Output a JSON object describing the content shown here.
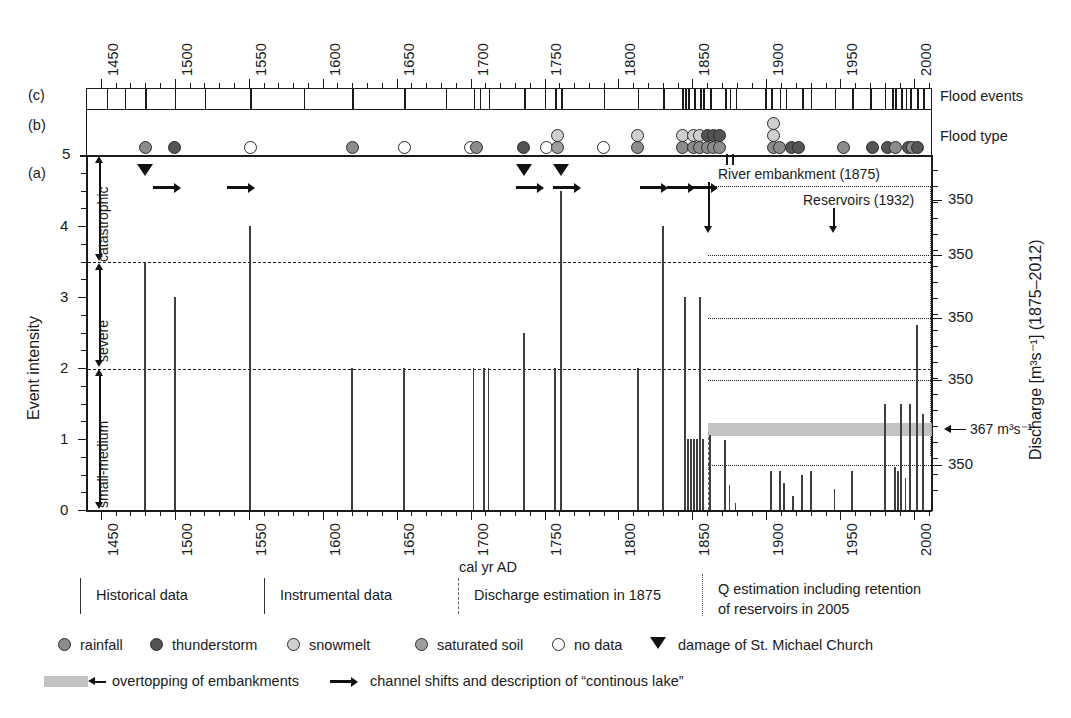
{
  "figure": {
    "panels": [
      {
        "tag": "(c)",
        "right_label": "Flood events"
      },
      {
        "tag": "(b)",
        "right_label": "Flood type"
      },
      {
        "tag": "(a)",
        "right_label": ""
      }
    ],
    "axis_x_label": "cal yr AD",
    "axis_y_left_label": "Event intensity",
    "axis_y_right_label": "Discharge [m³s⁻¹] (1875–2012)",
    "intensity_classes": [
      "catastrophic",
      "severe",
      "small-medium"
    ],
    "annotations": [
      {
        "text": "River embankment (1875)",
        "year": 1875
      },
      {
        "text": "Reservoirs (1932)",
        "year": 1932
      },
      {
        "text": "367 m³s⁻¹",
        "year": null
      }
    ],
    "data_period_bands": [
      {
        "label": "Historical data"
      },
      {
        "label": "Instrumental data"
      },
      {
        "label": "Discharge estimation in 1875"
      },
      {
        "label": "Q estimation including retention of reservoirs in 2005"
      }
    ],
    "legend_markers": [
      {
        "name": "rainfall",
        "color": "#8c8c8c"
      },
      {
        "name": "thunderstorm",
        "color": "#545454"
      },
      {
        "name": "snowmelt",
        "color": "#cfcfcf"
      },
      {
        "name": "saturated soil",
        "color": "#9e9e9e"
      },
      {
        "name": "no data",
        "color": "#ffffff"
      }
    ],
    "legend_symbols": [
      {
        "name": "damage of St. Michael Church",
        "glyph": "triangle-down"
      },
      {
        "name": "overtopping of embankments",
        "glyph": "gray-band"
      },
      {
        "name": "channel shifts and description of “continous lake”",
        "glyph": "arrow-right"
      }
    ]
  },
  "chart_data": {
    "type": "bar",
    "title": "",
    "xlabel": "cal yr AD",
    "ylabel": "Event intensity",
    "y2label": "Discharge [m³s⁻¹] (1875–2012)",
    "xlim": [
      1440,
      2012
    ],
    "ylim": [
      0,
      5
    ],
    "xticks": [
      1450,
      1500,
      1550,
      1600,
      1650,
      1700,
      1750,
      1800,
      1850,
      1900,
      1950,
      2000
    ],
    "xtick_labels": [
      "1450",
      "1500",
      "1550",
      "1600",
      "1650",
      "1700",
      "1750",
      "1800",
      "1850",
      "1900",
      "1950",
      "2000"
    ],
    "yticks": [
      0,
      1,
      2,
      3,
      4,
      5
    ],
    "ytick_labels": [
      "0",
      "1",
      "2",
      "3",
      "4",
      "5"
    ],
    "y2ticks_labels": [
      "350",
      "350",
      "350",
      "350",
      "367 m³s⁻¹",
      "350"
    ],
    "grid": "dashed-horizontal-at-2-and-3.5",
    "legend_position": "below-axes",
    "class_boundaries": {
      "small-medium": [
        0,
        2
      ],
      "severe": [
        2,
        3.5
      ],
      "catastrophic": [
        3.5,
        5
      ]
    },
    "series": [
      {
        "name": "Event intensity (a)",
        "points": [
          {
            "year": 1480,
            "value": 3.5
          },
          {
            "year": 1500,
            "value": 3.0
          },
          {
            "year": 1551,
            "value": 4.0
          },
          {
            "year": 1620,
            "value": 2.0
          },
          {
            "year": 1655,
            "value": 2.0
          },
          {
            "year": 1702,
            "value": 2.0
          },
          {
            "year": 1709,
            "value": 2.0
          },
          {
            "year": 1712,
            "value": 2.0
          },
          {
            "year": 1736,
            "value": 2.5
          },
          {
            "year": 1757,
            "value": 2.0
          },
          {
            "year": 1761,
            "value": 4.5
          },
          {
            "year": 1813,
            "value": 2.0
          },
          {
            "year": 1830,
            "value": 4.0
          },
          {
            "year": 1845,
            "value": 3.0
          },
          {
            "year": 1847,
            "value": 1.0
          },
          {
            "year": 1849,
            "value": 1.0
          },
          {
            "year": 1851,
            "value": 1.0
          },
          {
            "year": 1853,
            "value": 1.0
          },
          {
            "year": 1855,
            "value": 3.0
          },
          {
            "year": 1857,
            "value": 1.0
          },
          {
            "year": 1862,
            "value": 1.05
          },
          {
            "year": 1872,
            "value": 0.98
          },
          {
            "year": 1875,
            "value": 0.35
          },
          {
            "year": 1879,
            "value": 0.1
          },
          {
            "year": 1903,
            "value": 0.55
          },
          {
            "year": 1909,
            "value": 0.55
          },
          {
            "year": 1912,
            "value": 0.38
          },
          {
            "year": 1918,
            "value": 0.2
          },
          {
            "year": 1924,
            "value": 0.5
          },
          {
            "year": 1930,
            "value": 0.55
          },
          {
            "year": 1946,
            "value": 0.3
          },
          {
            "year": 1958,
            "value": 0.55
          },
          {
            "year": 1980,
            "value": 1.5
          },
          {
            "year": 1987,
            "value": 0.6
          },
          {
            "year": 1989,
            "value": 0.55
          },
          {
            "year": 1991,
            "value": 1.5
          },
          {
            "year": 1994,
            "value": 0.45
          },
          {
            "year": 1997,
            "value": 1.5
          },
          {
            "year": 2002,
            "value": 2.6
          },
          {
            "year": 2006,
            "value": 1.35
          }
        ]
      }
    ],
    "flood_events_ticks": [
      1454,
      1466,
      1480,
      1500,
      1520,
      1551,
      1587,
      1620,
      1655,
      1683,
      1702,
      1706,
      1712,
      1736,
      1750,
      1757,
      1761,
      1790,
      1813,
      1830,
      1843,
      1845,
      1847,
      1851,
      1855,
      1857,
      1862,
      1872,
      1875,
      1879,
      1899,
      1903,
      1909,
      1913,
      1924,
      1930,
      1946,
      1958,
      1970,
      1980,
      1985,
      1987,
      1991,
      1994,
      1997,
      2002,
      2006
    ],
    "flood_type_points": [
      {
        "year": 1480,
        "type": "rainfall",
        "row": 0
      },
      {
        "year": 1500,
        "type": "thunderstorm",
        "row": 0
      },
      {
        "year": 1551,
        "type": "no data",
        "row": 0
      },
      {
        "year": 1620,
        "type": "rainfall",
        "row": 0
      },
      {
        "year": 1655,
        "type": "no data",
        "row": 0
      },
      {
        "year": 1700,
        "type": "no data",
        "row": 0
      },
      {
        "year": 1704,
        "type": "rainfall",
        "row": 0
      },
      {
        "year": 1736,
        "type": "thunderstorm",
        "row": 0
      },
      {
        "year": 1751,
        "type": "no data",
        "row": 0
      },
      {
        "year": 1759,
        "type": "snowmelt",
        "row": 1
      },
      {
        "year": 1759,
        "type": "saturated soil",
        "row": 0
      },
      {
        "year": 1790,
        "type": "no data",
        "row": 0
      },
      {
        "year": 1813,
        "type": "snowmelt",
        "row": 1
      },
      {
        "year": 1813,
        "type": "rainfall",
        "row": 0
      },
      {
        "year": 1843,
        "type": "snowmelt",
        "row": 1
      },
      {
        "year": 1843,
        "type": "rainfall",
        "row": 0
      },
      {
        "year": 1851,
        "type": "snowmelt",
        "row": 1
      },
      {
        "year": 1851,
        "type": "rainfall",
        "row": 0
      },
      {
        "year": 1855,
        "type": "snowmelt",
        "row": 1
      },
      {
        "year": 1855,
        "type": "rainfall",
        "row": 0
      },
      {
        "year": 1860,
        "type": "thunderstorm",
        "row": 1
      },
      {
        "year": 1860,
        "type": "rainfall",
        "row": 0
      },
      {
        "year": 1864,
        "type": "thunderstorm",
        "row": 1
      },
      {
        "year": 1864,
        "type": "rainfall",
        "row": 0
      },
      {
        "year": 1868,
        "type": "thunderstorm",
        "row": 1
      },
      {
        "year": 1868,
        "type": "rainfall",
        "row": 0
      },
      {
        "year": 1905,
        "type": "snowmelt",
        "row": 2
      },
      {
        "year": 1905,
        "type": "snowmelt",
        "row": 1
      },
      {
        "year": 1905,
        "type": "rainfall",
        "row": 0
      },
      {
        "year": 1909,
        "type": "rainfall",
        "row": 0
      },
      {
        "year": 1917,
        "type": "thunderstorm",
        "row": 0
      },
      {
        "year": 1922,
        "type": "thunderstorm",
        "row": 0
      },
      {
        "year": 1952,
        "type": "rainfall",
        "row": 0
      },
      {
        "year": 1972,
        "type": "thunderstorm",
        "row": 0
      },
      {
        "year": 1982,
        "type": "thunderstorm",
        "row": 0
      },
      {
        "year": 1987,
        "type": "rainfall",
        "row": 0
      },
      {
        "year": 1996,
        "type": "thunderstorm",
        "row": 0
      },
      {
        "year": 1999,
        "type": "rainfall",
        "row": 0
      },
      {
        "year": 2002,
        "type": "thunderstorm",
        "row": 0
      }
    ],
    "church_damage_years": [
      1480,
      1736,
      1761
    ],
    "channel_shift_years": [
      1495,
      1545,
      1740,
      1765,
      1824,
      1842,
      1858
    ],
    "overtopping_band": {
      "start_year": 1875,
      "end_year": 2012,
      "value": 1.0
    }
  }
}
